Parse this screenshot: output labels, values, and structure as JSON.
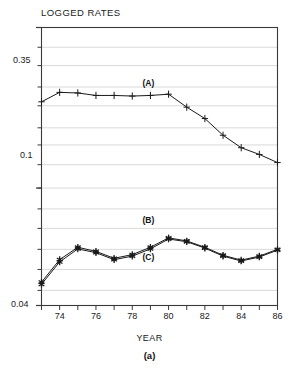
{
  "chart_data": {
    "type": "line",
    "title": "LOGGED RATES",
    "xlabel": "YEAR",
    "ylabel": "",
    "caption": "(a)",
    "yscale": "log",
    "ylim": [
      0.04,
      0.35
    ],
    "ytick_labels": [
      "0.35",
      "0.1",
      "0.04"
    ],
    "ytick_values": [
      0.35,
      0.1,
      0.04
    ],
    "gridlines_y": [
      0.35,
      0.3,
      0.26,
      0.22,
      0.19,
      0.16,
      0.14,
      0.12,
      0.1,
      0.085,
      0.073,
      0.062,
      0.053,
      0.045
    ],
    "grid": true,
    "legend": "none",
    "xlim": [
      1973,
      1986
    ],
    "x": [
      1973,
      1974,
      1975,
      1976,
      1977,
      1978,
      1979,
      1980,
      1981,
      1982,
      1983,
      1984,
      1985,
      1986
    ],
    "xtick_labels": [
      "74",
      "76",
      "78",
      "80",
      "82",
      "84",
      "86"
    ],
    "xtick_values": [
      1974,
      1976,
      1978,
      1980,
      1982,
      1984,
      1986
    ],
    "series": [
      {
        "name": "(A)",
        "marker": "plus",
        "label_x": 1979.0,
        "label_y": 0.225,
        "values": [
          0.196,
          0.211,
          0.21,
          0.206,
          0.206,
          0.205,
          0.206,
          0.208,
          0.188,
          0.172,
          0.151,
          0.137,
          0.13,
          0.122
        ]
      },
      {
        "name": "(B)",
        "marker": "star",
        "label_x": 1979.0,
        "label_y": 0.0775,
        "values": [
          0.048,
          0.0572,
          0.063,
          0.061,
          0.0578,
          0.0595,
          0.063,
          0.0678,
          0.0662,
          0.063,
          0.0592,
          0.057,
          0.0588,
          0.062
        ]
      },
      {
        "name": "(C)",
        "marker": "star",
        "label_x": 1979.0,
        "label_y": 0.058,
        "values": [
          0.0472,
          0.0562,
          0.0622,
          0.0604,
          0.0572,
          0.0588,
          0.0622,
          0.0672,
          0.0658,
          0.0626,
          0.0588,
          0.0566,
          0.0584,
          0.0616
        ]
      }
    ]
  },
  "colors": {
    "axis": "#3a3a3a",
    "grid": "#c9c9c9",
    "line": "#1a1a1a",
    "text": "#222222"
  }
}
